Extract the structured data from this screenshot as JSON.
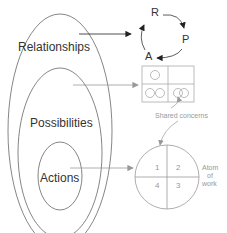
{
  "diagram": {
    "levels": [
      {
        "id": "relationships",
        "label": "Relationships"
      },
      {
        "id": "possibilities",
        "label": "Possibilities"
      },
      {
        "id": "actions",
        "label": "Actions"
      }
    ],
    "cycle": {
      "nodes": [
        "R",
        "P",
        "A"
      ]
    },
    "grid": {
      "annotation": "Shared concerns"
    },
    "atom": {
      "quadrants": [
        "1",
        "2",
        "3",
        "4"
      ],
      "label_lines": [
        "Atom",
        "of",
        "work"
      ]
    },
    "colors": {
      "dark_line": "#333333",
      "light_line": "#aaaaaa",
      "light_text": "#999999"
    }
  }
}
